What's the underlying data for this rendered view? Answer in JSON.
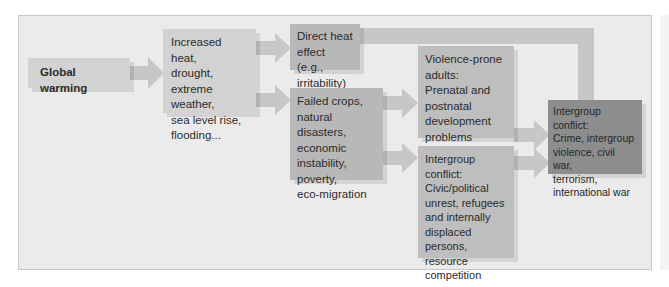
{
  "diagram": {
    "type": "flowchart",
    "title": "",
    "nodes": [
      {
        "id": "global_warming",
        "lines": [
          "Global warming"
        ]
      },
      {
        "id": "climate_effects",
        "lines": [
          "Increased heat,",
          "drought,",
          "extreme weather,",
          "sea level rise,",
          "flooding..."
        ]
      },
      {
        "id": "direct_heat",
        "lines": [
          "Direct heat",
          "effect (e.g.,",
          "irritability)"
        ]
      },
      {
        "id": "failed_crops",
        "lines": [
          "Failed crops,",
          "natural disasters,",
          "economic",
          "instability,",
          "poverty,",
          "eco-migration"
        ]
      },
      {
        "id": "violence_prone",
        "lines": [
          "Violence-prone",
          "adults:",
          "Prenatal and",
          "postnatal",
          "development",
          "problems"
        ]
      },
      {
        "id": "intergroup_civic",
        "lines": [
          "Intergroup",
          "conflict:",
          "Civic/political",
          "unrest, refugees",
          "and internally",
          "displaced persons,",
          "resource",
          "competition"
        ]
      },
      {
        "id": "intergroup_conflict",
        "lines": [
          "Intergroup conflict:",
          "Crime, intergroup",
          "violence, civil war,",
          "terrorism,",
          "international war"
        ]
      }
    ],
    "edges": [
      {
        "from": "global_warming",
        "to": "climate_effects"
      },
      {
        "from": "climate_effects",
        "to": "direct_heat"
      },
      {
        "from": "climate_effects",
        "to": "failed_crops"
      },
      {
        "from": "direct_heat",
        "to": "intergroup_conflict"
      },
      {
        "from": "failed_crops",
        "to": "violence_prone"
      },
      {
        "from": "failed_crops",
        "to": "intergroup_civic"
      },
      {
        "from": "violence_prone",
        "to": "intergroup_conflict"
      },
      {
        "from": "intergroup_civic",
        "to": "intergroup_conflict"
      }
    ],
    "colors": {
      "frame_bg": "#ebebeb",
      "light_box": "#d2d2d2",
      "mid_box": "#b8b8b8",
      "dark_box": "#8d8d8d",
      "arrow": "#c7c7c7"
    }
  }
}
